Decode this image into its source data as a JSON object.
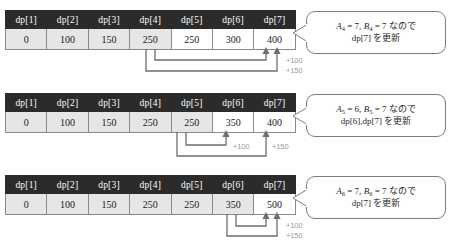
{
  "diagram": {
    "colors": {
      "header_bg": "#2b2b2b",
      "header_text": "#ffffff",
      "cell_shaded": "#e6e6e6",
      "cell_plain": "#ffffff",
      "border": "#8a8a8a",
      "arrow": "#6e6e6e",
      "delta_label": "#9a9a9a",
      "callout_border": "#7d7d7d"
    },
    "columns": [
      "dp[1]",
      "dp[2]",
      "dp[3]",
      "dp[4]",
      "dp[5]",
      "dp[6]",
      "dp[7]"
    ],
    "steps": [
      {
        "id": "step-1",
        "values": [
          "0",
          "100",
          "150",
          "250",
          "250",
          "300",
          "400"
        ],
        "shaded": [
          true,
          true,
          true,
          true,
          false,
          false,
          false
        ],
        "deltas": [
          "+100",
          "+150"
        ],
        "callout": {
          "line1_a_var": "A",
          "line1_a_sub": "4",
          "line1_a_val": "= 7,",
          "line1_b_var": "B",
          "line1_b_sub": "4",
          "line1_b_val": "= 7",
          "line1_suffix": "なので",
          "line2": "dp[7] を更新"
        }
      },
      {
        "id": "step-2",
        "values": [
          "0",
          "100",
          "150",
          "250",
          "250",
          "350",
          "400"
        ],
        "shaded": [
          true,
          true,
          true,
          true,
          true,
          false,
          false
        ],
        "deltas": [
          "+100",
          "+150"
        ],
        "callout": {
          "line1_a_var": "A",
          "line1_a_sub": "5",
          "line1_a_val": "= 6,",
          "line1_b_var": "B",
          "line1_b_sub": "5",
          "line1_b_val": "= 7",
          "line1_suffix": "なので",
          "line2": "dp[6],dp[7] を更新"
        }
      },
      {
        "id": "step-3",
        "values": [
          "0",
          "100",
          "150",
          "250",
          "250",
          "350",
          "500"
        ],
        "shaded": [
          true,
          true,
          true,
          true,
          true,
          true,
          false
        ],
        "deltas": [
          "+100",
          "+150"
        ],
        "callout": {
          "line1_a_var": "A",
          "line1_a_sub": "6",
          "line1_a_val": "= 7,",
          "line1_b_var": "B",
          "line1_b_sub": "6",
          "line1_b_val": "= 7",
          "line1_suffix": "なので",
          "line2": "dp[7] を更新"
        }
      }
    ]
  }
}
